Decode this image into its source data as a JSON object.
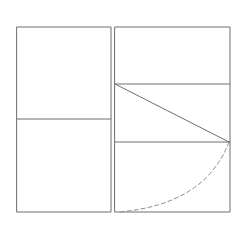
{
  "diagram": {
    "title": "",
    "style": {
      "background": "#ffffff",
      "stroke_color": "#6e6e6e",
      "stroke_width": 1,
      "dashed_stroke_color": "#8a8a8a",
      "dash_pattern": "4 3"
    },
    "left_panel": {
      "label": "",
      "rect": {
        "x": 17,
        "y": 27,
        "w": 94,
        "h": 185
      },
      "divider_y": 119
    },
    "right_panel": {
      "label": "",
      "rect": {
        "x": 115,
        "y": 27,
        "w": 115,
        "h": 185
      },
      "divider_ys": [
        84,
        142
      ]
    },
    "diagonal": {
      "x1": 115,
      "y1": 84,
      "x2": 229,
      "y2": 142
    },
    "dashed_arc": {
      "start": [
        229,
        142
      ],
      "control": [
        205,
        205
      ],
      "end": [
        118,
        212
      ]
    }
  }
}
